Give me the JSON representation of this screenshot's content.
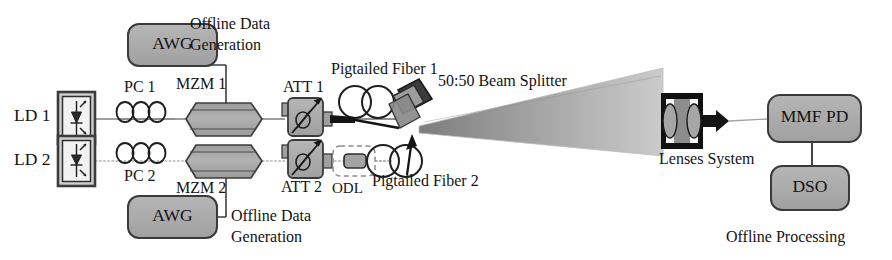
{
  "figure": {
    "type": "optical-experimental-schematic",
    "width": 892,
    "height": 260
  },
  "colors": {
    "background": "#ffffff",
    "component_fill": "#a9a9a9",
    "component_fill_light": "#b4b4b4",
    "component_stroke": "#3a3a3a",
    "line": "#555555",
    "text": "#131313",
    "beam_near": "#8f8f8f",
    "beam_far": "#c9c9c9",
    "beam_splitter_fill": "#9a9a9a",
    "connector_fill": "#1f1f1f"
  },
  "upper_branch": {
    "source": {
      "label": "LD 1",
      "icon": "laser-diode-icon"
    },
    "polarization_controller": {
      "label": "PC 1",
      "icon": "fiber-loops-icon",
      "loops": 3
    },
    "modulator": {
      "label": "MZM 1",
      "icon": "mach-zehnder-modulator-icon"
    },
    "driver": {
      "label": "AWG",
      "icon": "arbitrary-waveform-generator-icon"
    },
    "driver_note": {
      "line1": "Offline Data",
      "line2": "Generation"
    },
    "attenuator": {
      "label": "ATT 1",
      "icon": "variable-attenuator-icon"
    },
    "fiber": {
      "label": "Pigtailed Fiber 1",
      "icon": "fiber-coil-icon"
    }
  },
  "lower_branch": {
    "source": {
      "label": "LD 2",
      "icon": "laser-diode-icon"
    },
    "polarization_controller": {
      "label": "PC 2",
      "icon": "fiber-loops-icon",
      "loops": 3
    },
    "modulator": {
      "label": "MZM 2",
      "icon": "mach-zehnder-modulator-icon"
    },
    "driver": {
      "label": "AWG",
      "icon": "arbitrary-waveform-generator-icon"
    },
    "driver_note": {
      "line1": "Offline Data",
      "line2": "Generation"
    },
    "attenuator": {
      "label": "ATT 2",
      "icon": "variable-attenuator-icon"
    },
    "delay_line": {
      "label": "ODL",
      "icon": "optical-delay-line-icon"
    },
    "fiber": {
      "label": "Pigtailed Fiber 2",
      "icon": "fiber-coil-icon"
    }
  },
  "free_space": {
    "beam_splitter": {
      "label": "50:50 Beam Splitter",
      "icon": "beam-splitter-icon"
    },
    "beam": {
      "icon": "diverging-beam-icon"
    },
    "lenses": {
      "label": "Lenses System",
      "icon": "lens-pair-icon"
    }
  },
  "receiver": {
    "photodetector": {
      "label": "MMF PD",
      "icon": "photodetector-icon"
    },
    "oscilloscope": {
      "label": "DSO",
      "icon": "oscilloscope-icon"
    },
    "processing_note": "Offline Processing"
  }
}
